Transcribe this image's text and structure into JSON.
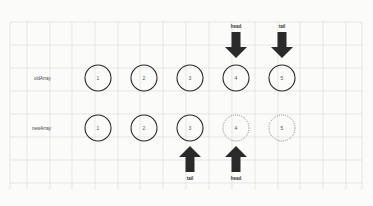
{
  "diagram": {
    "colors": {
      "background": "#fbfbfa",
      "grid": "#d9d9d6",
      "stroke": "#2a2a2a",
      "dotted_stroke": "#666666",
      "arrow": "#2a2a2a"
    },
    "rows": [
      {
        "label": "oldArray",
        "nodes": [
          {
            "value": "1",
            "style": "solid"
          },
          {
            "value": "2",
            "style": "solid"
          },
          {
            "value": "3",
            "style": "solid"
          },
          {
            "value": "4",
            "style": "solid"
          },
          {
            "value": "5",
            "style": "solid"
          }
        ],
        "pointers": [
          {
            "label": "head",
            "node_index": 3,
            "direction": "down",
            "position": "above"
          },
          {
            "label": "tail",
            "node_index": 4,
            "direction": "down",
            "position": "above"
          }
        ]
      },
      {
        "label": "newArray",
        "nodes": [
          {
            "value": "1",
            "style": "solid"
          },
          {
            "value": "2",
            "style": "solid"
          },
          {
            "value": "3",
            "style": "solid"
          },
          {
            "value": "4",
            "style": "dotted"
          },
          {
            "value": "5",
            "style": "dotted"
          }
        ],
        "pointers": [
          {
            "label": "tail",
            "node_index": 2,
            "direction": "up",
            "position": "below"
          },
          {
            "label": "head",
            "node_index": 3,
            "direction": "up",
            "position": "below"
          }
        ]
      }
    ]
  }
}
